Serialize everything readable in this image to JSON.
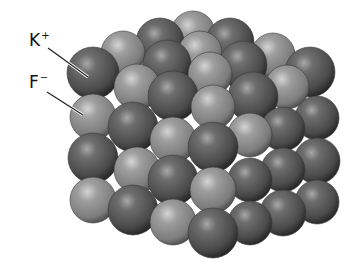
{
  "diagram": {
    "labels": [
      {
        "id": "k",
        "symbol": "K",
        "charge": "+",
        "x": 29,
        "y": 31,
        "line": [
          48,
          48,
          88,
          77
        ]
      },
      {
        "id": "f",
        "symbol": "F",
        "charge": "−",
        "x": 29,
        "y": 73,
        "line": [
          47,
          92,
          83,
          115
        ]
      }
    ],
    "colors": {
      "cation_dark": "#555555",
      "cation_highlight": "#9a9a9a",
      "cation_shadow": "#2a2a2a",
      "anion_light": "#8c8c8c",
      "anion_highlight": "#c8c8c8",
      "anion_shadow": "#5a5a5a"
    },
    "ions": [
      {
        "type": "F",
        "x": 193,
        "y": 33,
        "r": 22
      },
      {
        "type": "K",
        "x": 160,
        "y": 42,
        "r": 24
      },
      {
        "type": "K",
        "x": 230,
        "y": 42,
        "r": 24
      },
      {
        "type": "F",
        "x": 123,
        "y": 53,
        "r": 22
      },
      {
        "type": "F",
        "x": 200,
        "y": 53,
        "r": 22
      },
      {
        "type": "F",
        "x": 273,
        "y": 55,
        "r": 22
      },
      {
        "type": "K",
        "x": 167,
        "y": 64,
        "r": 24
      },
      {
        "type": "K",
        "x": 243,
        "y": 65,
        "r": 24
      },
      {
        "type": "K",
        "x": 310,
        "y": 72,
        "r": 25
      },
      {
        "type": "F",
        "x": 210,
        "y": 74,
        "r": 22
      },
      {
        "type": "K",
        "x": 93,
        "y": 73,
        "r": 26
      },
      {
        "type": "F",
        "x": 137,
        "y": 87,
        "r": 23
      },
      {
        "type": "F",
        "x": 287,
        "y": 87,
        "r": 22
      },
      {
        "type": "K",
        "x": 173,
        "y": 96,
        "r": 25
      },
      {
        "type": "K",
        "x": 253,
        "y": 97,
        "r": 25
      },
      {
        "type": "F",
        "x": 213,
        "y": 107,
        "r": 22
      },
      {
        "type": "K",
        "x": 317,
        "y": 118,
        "r": 22
      },
      {
        "type": "K",
        "x": 283,
        "y": 129,
        "r": 22
      },
      {
        "type": "F",
        "x": 93,
        "y": 117,
        "r": 23
      },
      {
        "type": "F",
        "x": 250,
        "y": 135,
        "r": 22
      },
      {
        "type": "K",
        "x": 133,
        "y": 127,
        "r": 25
      },
      {
        "type": "F",
        "x": 173,
        "y": 140,
        "r": 23
      },
      {
        "type": "K",
        "x": 213,
        "y": 147,
        "r": 25
      },
      {
        "type": "K",
        "x": 317,
        "y": 161,
        "r": 23
      },
      {
        "type": "K",
        "x": 283,
        "y": 170,
        "r": 22
      },
      {
        "type": "K",
        "x": 250,
        "y": 180,
        "r": 22
      },
      {
        "type": "K",
        "x": 93,
        "y": 158,
        "r": 25
      },
      {
        "type": "F",
        "x": 137,
        "y": 170,
        "r": 23
      },
      {
        "type": "K",
        "x": 173,
        "y": 180,
        "r": 25
      },
      {
        "type": "F",
        "x": 213,
        "y": 190,
        "r": 23
      },
      {
        "type": "K",
        "x": 317,
        "y": 202,
        "r": 22
      },
      {
        "type": "K",
        "x": 283,
        "y": 213,
        "r": 23
      },
      {
        "type": "K",
        "x": 250,
        "y": 223,
        "r": 22
      },
      {
        "type": "F",
        "x": 93,
        "y": 200,
        "r": 23
      },
      {
        "type": "K",
        "x": 133,
        "y": 210,
        "r": 25
      },
      {
        "type": "F",
        "x": 173,
        "y": 222,
        "r": 23
      },
      {
        "type": "K",
        "x": 213,
        "y": 233,
        "r": 25
      }
    ]
  }
}
